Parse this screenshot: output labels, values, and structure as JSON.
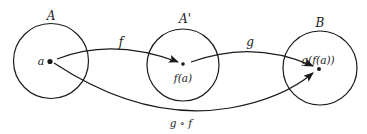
{
  "diagram": {
    "type": "function-composition",
    "colors": {
      "stroke": "#1a1a1a",
      "background": "#ffffff"
    },
    "sets": [
      {
        "id": "A",
        "label": "A",
        "point_label": "a"
      },
      {
        "id": "A_prime",
        "label": "A'",
        "point_label": "f(a)"
      },
      {
        "id": "B",
        "label": "B",
        "point_label": "g(f(a))"
      }
    ],
    "arrows": [
      {
        "id": "f",
        "label": "f",
        "from": "a",
        "to": "f(a)"
      },
      {
        "id": "g",
        "label": "g",
        "from": "f(a)",
        "to": "g(f(a))"
      },
      {
        "id": "gof",
        "label": "g ∘ f",
        "from": "a",
        "to": "g(f(a))"
      }
    ]
  }
}
